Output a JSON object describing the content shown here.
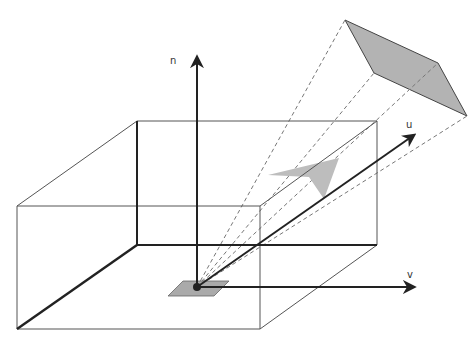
{
  "diagram": {
    "type": "3d-coordinate-projection",
    "axes": [
      {
        "id": "n",
        "label": "n",
        "from": [
          197,
          287
        ],
        "to": [
          197,
          55
        ],
        "label_pos": [
          170,
          63
        ]
      },
      {
        "id": "u",
        "label": "u",
        "from": [
          197,
          287
        ],
        "to": [
          416,
          133
        ],
        "label_pos": [
          407,
          127
        ]
      },
      {
        "id": "v",
        "label": "v",
        "from": [
          197,
          287
        ],
        "to": [
          416,
          287
        ],
        "label_pos": [
          408,
          277
        ]
      }
    ],
    "origin": {
      "x": 197,
      "y": 287
    },
    "colors": {
      "line_dark": "#222222",
      "line_thin": "#555555",
      "dash": "#777777",
      "fill_gray": "#b3b3b3",
      "fill_gray_light": "#bdbdbd",
      "background": "#ffffff"
    }
  }
}
